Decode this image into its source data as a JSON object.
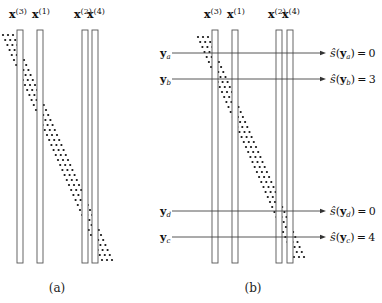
{
  "panels": [
    {
      "id": "a",
      "caption": "(a)",
      "columns": [
        {
          "symbol": "x",
          "superscript": "(3)"
        },
        {
          "symbol": "x",
          "superscript": "(1)"
        },
        {
          "symbol": "x",
          "superscript": "(2)"
        },
        {
          "symbol": "x",
          "superscript": "(4)"
        }
      ],
      "dot_band": {
        "dots_per_row": 3,
        "direction": "top-left to bottom-right"
      }
    },
    {
      "id": "b",
      "caption": "(b)",
      "columns": [
        {
          "symbol": "x",
          "superscript": "(3)"
        },
        {
          "symbol": "x",
          "superscript": "(1)"
        },
        {
          "symbol": "x",
          "superscript": "(2)"
        },
        {
          "symbol": "x",
          "superscript": "(4)"
        }
      ],
      "dot_band": {
        "dots_per_row": 3,
        "direction": "top-left to bottom-right"
      },
      "queries": [
        {
          "symbol": "y",
          "subscript": "a",
          "result_label": "ŝ(y",
          "result_sub": "a",
          "result_value": "0"
        },
        {
          "symbol": "y",
          "subscript": "b",
          "result_label": "ŝ(y",
          "result_sub": "b",
          "result_value": "3"
        },
        {
          "symbol": "y",
          "subscript": "d",
          "result_label": "ŝ(y",
          "result_sub": "d",
          "result_value": "0"
        },
        {
          "symbol": "y",
          "subscript": "c",
          "result_label": "ŝ(y",
          "result_sub": "c",
          "result_value": "4"
        }
      ]
    }
  ]
}
